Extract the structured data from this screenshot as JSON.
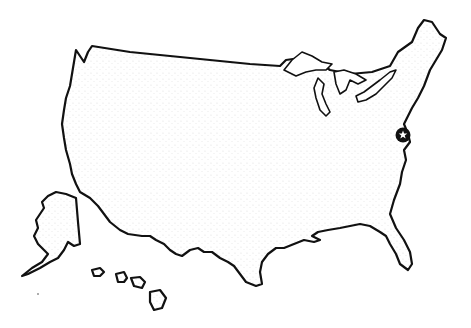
{
  "map": {
    "title": "United States outline map",
    "style": "stippled pen-and-ink line art",
    "regions": [
      "contiguous-us",
      "great-lakes",
      "alaska",
      "hawaii"
    ],
    "marker": {
      "icon": "star-in-circle-icon",
      "label": "Washington, D.C.",
      "color": "#111111"
    },
    "colors": {
      "ink": "#111111",
      "background": "#ffffff"
    }
  }
}
